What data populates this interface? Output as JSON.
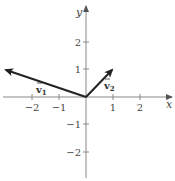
{
  "diagram": {
    "type": "coordinate-plane-vectors",
    "axes": {
      "x_label": "x",
      "y_label": "y",
      "x_ticks": [
        {
          "value": -2,
          "label": "−2"
        },
        {
          "value": -1,
          "label": "−1"
        },
        {
          "value": 1,
          "label": "1"
        },
        {
          "value": 2,
          "label": "2"
        }
      ],
      "y_ticks": [
        {
          "value": 2,
          "label": "2"
        },
        {
          "value": 1,
          "label": "1"
        },
        {
          "value": -1,
          "label": "−1"
        },
        {
          "value": -2,
          "label": "−2"
        }
      ]
    },
    "vectors": [
      {
        "name": "v1",
        "label": "v",
        "subscript": "1",
        "from": [
          0,
          0
        ],
        "to": [
          -3,
          1
        ]
      },
      {
        "name": "v2",
        "label": "v",
        "subscript": "2",
        "from": [
          0,
          0
        ],
        "to": [
          1,
          1
        ]
      }
    ],
    "colors": {
      "axis": "#888888",
      "vector": "#222222",
      "text": "#444444"
    }
  }
}
